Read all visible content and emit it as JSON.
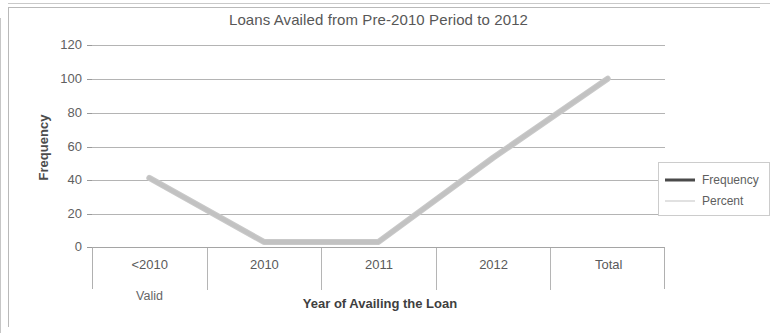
{
  "chart_data": {
    "type": "line",
    "title": "Loans Availed from Pre-2010 Period to 2012",
    "xlabel": "Year of Availing the Loan",
    "ylabel": "Frequency",
    "group_label": "Valid",
    "categories": [
      "<2010",
      "2010",
      "2011",
      "2012",
      "Total"
    ],
    "ylim": [
      0,
      120
    ],
    "yticks": [
      120,
      100,
      80,
      60,
      40,
      20,
      0
    ],
    "grid": true,
    "legend_position": "right",
    "series": [
      {
        "name": "Frequency",
        "color": "#4a4a4a",
        "values": [
          41,
          3,
          3,
          53,
          100
        ]
      },
      {
        "name": "Percent",
        "color": "#c4c4c4",
        "values": [
          41,
          3,
          3,
          53,
          100
        ]
      }
    ]
  },
  "legend": {
    "items": [
      {
        "label": "Frequency",
        "swatch": "frequency-line-swatch"
      },
      {
        "label": "Percent",
        "swatch": "percent-line-swatch"
      }
    ]
  }
}
